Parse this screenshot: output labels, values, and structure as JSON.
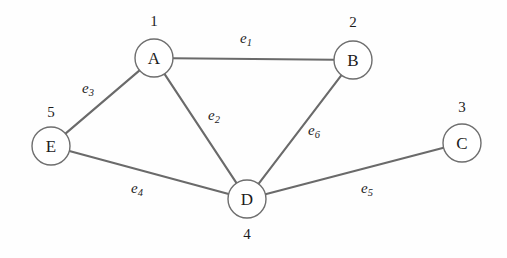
{
  "diagram": {
    "background_color": "#fefefe",
    "edge_color": "#6a6a6a",
    "node_stroke_color": "#6e6e6e",
    "node_fill_color": "#ffffff",
    "text_color": "#1c1c1c",
    "nodes": [
      {
        "id": "A",
        "letter": "A",
        "number": "1",
        "cx": 154,
        "cy": 58,
        "r": 19,
        "number_x": 154,
        "number_y": 21,
        "number_pos": "above"
      },
      {
        "id": "B",
        "letter": "B",
        "number": "2",
        "cx": 353,
        "cy": 60,
        "r": 19,
        "number_x": 353,
        "number_y": 22,
        "number_pos": "above"
      },
      {
        "id": "C",
        "letter": "C",
        "number": "3",
        "cx": 462,
        "cy": 143,
        "r": 19,
        "number_x": 462,
        "number_y": 107,
        "number_pos": "above"
      },
      {
        "id": "D",
        "letter": "D",
        "number": "4",
        "cx": 247,
        "cy": 199,
        "r": 19,
        "number_x": 247,
        "number_y": 234,
        "number_pos": "below"
      },
      {
        "id": "E",
        "letter": "E",
        "number": "5",
        "cx": 51,
        "cy": 146,
        "r": 19,
        "number_x": 51,
        "number_y": 112,
        "number_pos": "above"
      }
    ],
    "edges": [
      {
        "id": "e1",
        "label_base": "e",
        "label_sub": "1",
        "from": "A",
        "to": "B",
        "label_x": 246,
        "label_y": 38
      },
      {
        "id": "e2",
        "label_base": "e",
        "label_sub": "2",
        "from": "A",
        "to": "D",
        "label_x": 214,
        "label_y": 115
      },
      {
        "id": "e3",
        "label_base": "e",
        "label_sub": "3",
        "from": "A",
        "to": "E",
        "label_x": 88,
        "label_y": 88
      },
      {
        "id": "e4",
        "label_base": "e",
        "label_sub": "4",
        "from": "E",
        "to": "D",
        "label_x": 137,
        "label_y": 188
      },
      {
        "id": "e5",
        "label_base": "e",
        "label_sub": "5",
        "from": "D",
        "to": "C",
        "label_x": 367,
        "label_y": 188
      },
      {
        "id": "e6",
        "label_base": "e",
        "label_sub": "6",
        "from": "D",
        "to": "B",
        "label_x": 314,
        "label_y": 130
      }
    ]
  }
}
